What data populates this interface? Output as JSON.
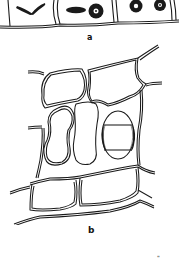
{
  "figure": {
    "panels": [
      {
        "id": "a",
        "label": "a",
        "description": "row of epidermal cells with chloroplast bodies (two elongated, several rosette-like)"
      },
      {
        "id": "b",
        "label": "b",
        "description": "cell network with double-walled cells; one cell with shaded crescent edges"
      }
    ],
    "page_mark": "\""
  },
  "colors": {
    "ink": "#1a1a1a",
    "paper": "#ffffff"
  }
}
